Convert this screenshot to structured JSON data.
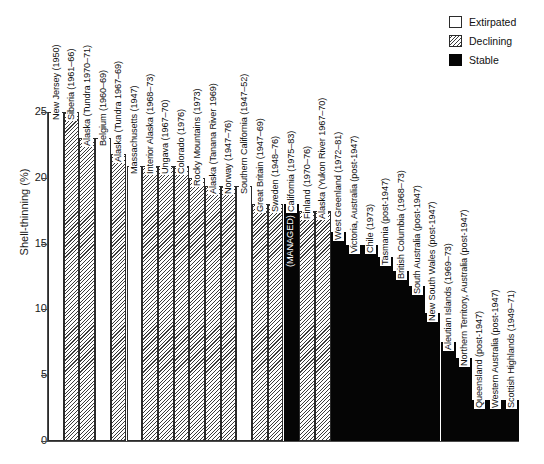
{
  "chart_data": {
    "type": "bar",
    "title": "",
    "xlabel": "",
    "ylabel": "Shell-thinning (%)",
    "ylim": [
      0,
      25
    ],
    "yticks": [
      0,
      5,
      10,
      15,
      20,
      25
    ],
    "grid": false,
    "legend": {
      "position": "top-right",
      "entries": [
        {
          "label": "Extirpated",
          "fill": "white",
          "color": "#ffffff"
        },
        {
          "label": "Declining",
          "fill": "hatched",
          "color": "#3d3d3d"
        },
        {
          "label": "Stable",
          "fill": "black",
          "color": "#050505"
        }
      ]
    },
    "categories": [
      "New Jersey (1950)",
      "Siberia (1961–66)",
      "Alaska (Tundra 1970–71)",
      "Belgium (1960–69)",
      "Alaska (Tundra 1967–69)",
      "Massachusetts (1947)",
      "Interior Alaska (1968–73)",
      "Ungava (1967–70)",
      "Colorado (1976)",
      "Rocky Mountains (1973)",
      "Alaska (Tanana River 1969)",
      "Norway (1947–76)",
      "Southern California (1947–52)",
      "Great Britain (1947–69)",
      "Sweden (1948–76)",
      "California (1975–83)",
      "Finland (1970–76)",
      "Alaska (Yukon River 1967–70)",
      "West Greenland (1972–81)",
      "Victoria, Australia (post-1947)",
      "Chile (1973)",
      "Tasmania (post-1947)",
      "British Columbia (1968–73)",
      "South Australia (post-1947)",
      "New South Wales (post-1947)",
      "Aleutian Islands (1969–73)",
      "Northern Territory, Australia (post-1947)",
      "Queensland (post-1947)",
      "Western Australia (post-1947)",
      "Scottish Highlands (1949–71)"
    ],
    "values": [
      25.0,
      25.0,
      23.0,
      23.0,
      21.8,
      20.9,
      20.9,
      20.9,
      20.9,
      20.0,
      19.4,
      19.4,
      19.4,
      18.0,
      18.0,
      18.0,
      17.5,
      17.5,
      15.9,
      14.9,
      14.9,
      14.0,
      12.9,
      11.8,
      9.7,
      7.5,
      6.3,
      3.1,
      3.1,
      3.1
    ],
    "status": [
      "Extirpated",
      "Declining",
      "Declining",
      "Extirpated",
      "Declining",
      "Extirpated",
      "Declining",
      "Declining",
      "Declining",
      "Declining",
      "Declining",
      "Declining",
      "Extirpated",
      "Declining",
      "Declining",
      "Stable",
      "Declining",
      "Declining",
      "Stable",
      "Stable",
      "Stable",
      "Stable",
      "Stable",
      "Stable",
      "Stable",
      "Stable",
      "Stable",
      "Stable",
      "Stable",
      "Stable"
    ],
    "annotations": [
      {
        "category": "California (1975–83)",
        "text": "(MANAGED)"
      }
    ]
  }
}
